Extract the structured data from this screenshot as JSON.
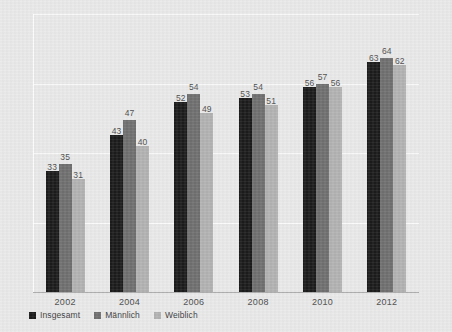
{
  "chart_data": {
    "type": "bar",
    "title": "",
    "subtitle": "",
    "xlabel": "",
    "ylabel": "",
    "categories": [
      "2002",
      "2004",
      "2006",
      "2008",
      "2010",
      "2012"
    ],
    "series": [
      {
        "name": "Insgesamt",
        "color": "#1b1b1b",
        "values": [
          33,
          43,
          52,
          53,
          56,
          63
        ]
      },
      {
        "name": "Männlich",
        "color": "#6f6f6f",
        "values": [
          35,
          47,
          54,
          54,
          57,
          64
        ]
      },
      {
        "name": "Weiblich",
        "color": "#b2b2b2",
        "values": [
          31,
          40,
          49,
          51,
          56,
          62
        ]
      }
    ],
    "ylim": [
      0,
      76
    ],
    "y_tick_labels": [],
    "grid": true,
    "grid_orientation": "horizontal",
    "gridline_values": [
      19,
      38,
      57,
      76
    ],
    "legend_position": "bottom-left",
    "data_labels": true,
    "background_color": "#e9e9e9",
    "axis_line_color": "#a9a9a9",
    "gridline_color": "#ffffff",
    "label_text_color": "#4e4e4e"
  },
  "legend": {
    "items": [
      {
        "label": "Insgesamt"
      },
      {
        "label": "Männlich"
      },
      {
        "label": "Weiblich"
      }
    ]
  }
}
